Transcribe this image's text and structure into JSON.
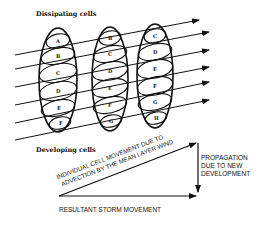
{
  "diagram": {
    "labels": {
      "top": "Dissipating cells",
      "bottom": "Developing cells",
      "advection_line1": "INDIVIDUAL  CELL  MOVEMENT  DUE TO",
      "advection_line2": "ADVECTION BY THE MEAN LAYER WIND",
      "propagation_line1": "PROPAGATION",
      "propagation_line2": "DUE  TO  NEW",
      "propagation_line3": "DEVELOPMENT",
      "resultant": "RESULTANT STORM MOVEMENT"
    },
    "columns": [
      {
        "name": "storm-column-1",
        "cells": [
          "A",
          "B",
          "C",
          "D",
          "E",
          "F"
        ]
      },
      {
        "name": "storm-column-2",
        "cells": [
          "B",
          "C",
          "D",
          "E",
          "F",
          "G"
        ]
      },
      {
        "name": "storm-column-3",
        "cells": [
          "C",
          "D",
          "E",
          "F",
          "G",
          "H"
        ]
      }
    ],
    "colors": {
      "ink": "#111111",
      "background": "#ffffff"
    }
  }
}
